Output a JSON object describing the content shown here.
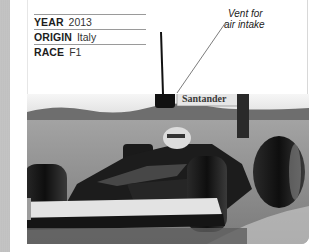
{
  "specs": [
    {
      "key": "YEAR",
      "value": "2013"
    },
    {
      "key": "ORIGIN",
      "value": "Italy"
    },
    {
      "key": "RACE",
      "value": "F1"
    }
  ],
  "callout": {
    "line1": "Vent for",
    "line2": "air intake"
  },
  "photo": {
    "subject": "Formula 1 racing car on track",
    "sponsor_text": "Santander",
    "colors": {
      "sky": "#f2f2f2",
      "track": "#8f8f8f",
      "car_body": "#1a1a1a",
      "tyre": "#111111",
      "wing": "#d9d9d9"
    }
  }
}
